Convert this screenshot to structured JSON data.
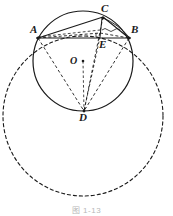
{
  "figure": {
    "caption": "图 1-13",
    "canvas": {
      "width": 173,
      "height": 216,
      "background": "#ffffff"
    },
    "stroke_color": "#1a1a1a",
    "labels": {
      "A": "A",
      "B": "B",
      "C": "C",
      "D": "D",
      "E": "E",
      "O": "O"
    },
    "points": {
      "A": {
        "x": 38,
        "y": 38
      },
      "B": {
        "x": 129,
        "y": 38
      },
      "C": {
        "x": 103,
        "y": 17
      },
      "D": {
        "x": 84,
        "y": 111
      },
      "E": {
        "x": 100,
        "y": 37
      },
      "O": {
        "x": 83,
        "y": 61
      }
    },
    "circles": [
      {
        "name": "inscribed-circle",
        "cx": 83,
        "cy": 61,
        "r": 50,
        "style": "solid",
        "label": "circle O"
      },
      {
        "name": "outer-circle",
        "cx": 83,
        "cy": 116,
        "r": 80,
        "style": "dashed",
        "label": "large dashed circle"
      }
    ],
    "segments": [
      {
        "name": "AB",
        "from": "A",
        "to": "B",
        "style": "solid"
      },
      {
        "name": "AC",
        "from": "A",
        "to": "C",
        "style": "solid"
      },
      {
        "name": "CB",
        "from": "C",
        "to": "B",
        "style": "solid"
      },
      {
        "name": "AE",
        "from": "A",
        "to": "E",
        "style": "dashed"
      },
      {
        "name": "EB",
        "from": "E",
        "to": "B",
        "style": "dashed"
      },
      {
        "name": "CE",
        "from": "C",
        "to": "E",
        "style": "solid"
      },
      {
        "name": "AD",
        "from": "A",
        "to": "D",
        "style": "dashed"
      },
      {
        "name": "BD",
        "from": "B",
        "to": "D",
        "style": "dashed"
      },
      {
        "name": "CD",
        "from": "C",
        "to": "D",
        "style": "dashed"
      },
      {
        "name": "ED",
        "from": "E",
        "to": "D",
        "style": "dashed"
      },
      {
        "name": "OD",
        "from": "O",
        "to": "D",
        "style": "dashed"
      }
    ],
    "marks": {
      "right_angle_at_E": true,
      "center_dot": true
    }
  }
}
